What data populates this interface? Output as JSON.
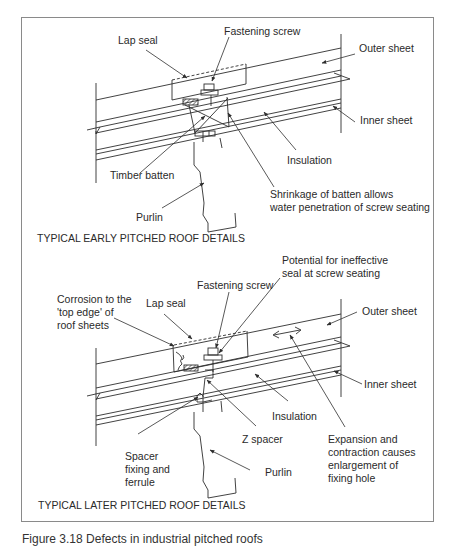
{
  "figure": {
    "caption": "Figure 3.18 Defects in industrial pitched roofs",
    "frame_color": "#8a8a8a",
    "line_color": "#2e2e2e"
  },
  "early": {
    "title": "TYPICAL EARLY PITCHED ROOF DETAILS",
    "labels": {
      "lap_seal": "Lap seal",
      "fastening_screw": "Fastening screw",
      "outer_sheet": "Outer sheet",
      "inner_sheet": "Inner sheet",
      "insulation": "Insulation",
      "timber_batten": "Timber batten",
      "shrinkage_line1": "Shrinkage of batten allows",
      "shrinkage_line2": "water penetration of screw seating",
      "purlin": "Purlin"
    }
  },
  "later": {
    "title": "TYPICAL LATER PITCHED ROOF DETAILS",
    "labels": {
      "potential_line1": "Potential for ineffective",
      "potential_line2": "seal at screw seating",
      "fastening_screw": "Fastening screw",
      "corrosion_line1": "Corrosion to the",
      "corrosion_line2": "'top edge' of",
      "corrosion_line3": "roof sheets",
      "lap_seal": "Lap seal",
      "outer_sheet": "Outer sheet",
      "inner_sheet": "Inner sheet",
      "insulation": "Insulation",
      "z_spacer": "Z spacer",
      "spacer_line1": "Spacer",
      "spacer_line2": "fixing and",
      "spacer_line3": "ferrule",
      "purlin": "Purlin",
      "expansion_line1": "Expansion and",
      "expansion_line2": "contraction causes",
      "expansion_line3": "enlargement of",
      "expansion_line4": "fixing hole"
    }
  }
}
